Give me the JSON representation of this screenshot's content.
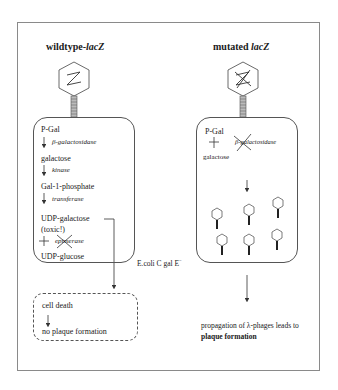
{
  "diagram": {
    "left_panel": {
      "title_prefix": "wildtype-",
      "title_gene": "lacZ",
      "phage_head_label": "Z",
      "pathway": [
        {
          "metabolite": "P-Gal",
          "enzyme": "β-galactosidase",
          "blocked": false
        },
        {
          "metabolite": "galactose",
          "enzyme": "kinase",
          "blocked": false
        },
        {
          "metabolite": "Gal-1-phosphate",
          "enzyme": "transferase",
          "blocked": false
        },
        {
          "metabolite": "UDP-galactose",
          "enzyme": "epimerase",
          "blocked": true
        },
        {
          "metabolite": "UDP-glucose"
        }
      ],
      "toxic_note": "(toxic!)",
      "host_label": "E.coli C gal E",
      "host_superscript": "−",
      "outcome_box": {
        "line1": "cell death",
        "line2": "no plaque formation"
      }
    },
    "right_panel": {
      "title_prefix": "mutated ",
      "title_gene": "lacZ",
      "phage_head_label": "Z (crossed out)",
      "pathway": [
        {
          "metabolite": "P-Gal",
          "enzyme": "β-galactosidase",
          "blocked": true
        },
        {
          "metabolite": "galactose"
        }
      ],
      "progeny_phage_count": 6,
      "outcome_line1": "propagation of λ-phages leads to",
      "outcome_line2": "plaque formation"
    },
    "colors": {
      "stroke": "#333333",
      "frame": "#8a8a8a",
      "background": "#ffffff"
    }
  }
}
